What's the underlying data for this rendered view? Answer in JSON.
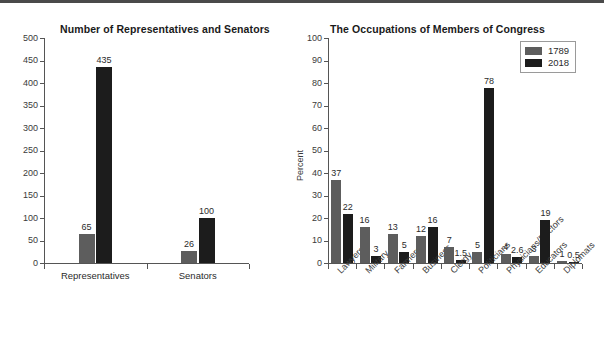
{
  "colors": {
    "series_1789": "#5d5d5d",
    "series_2018": "#1c1c1c",
    "axis": "#555555",
    "text": "#2b2b2b",
    "background": "#ffffff",
    "top_border": "#4a4a4a"
  },
  "legend": {
    "position": "top-right",
    "entries": [
      {
        "label": "1789",
        "color": "#5d5d5d"
      },
      {
        "label": "2018",
        "color": "#1c1c1c"
      }
    ]
  },
  "chart_data": [
    {
      "id": "chart-left",
      "type": "bar",
      "title": "Number of Representatives and Senators",
      "xlabel": "",
      "ylabel": "",
      "ylim": [
        0,
        500
      ],
      "yticks": [
        0,
        50,
        100,
        150,
        200,
        250,
        300,
        350,
        400,
        450,
        500
      ],
      "ytick_labels": [
        "0",
        "50",
        "100",
        "150",
        "200",
        "250",
        "300",
        "350",
        "400",
        "450",
        "500"
      ],
      "grid": false,
      "categories": [
        "Representatives",
        "Senators"
      ],
      "series": [
        {
          "name": "1789",
          "color": "#5d5d5d",
          "values": [
            65,
            26
          ],
          "labels": [
            "65",
            "26"
          ]
        },
        {
          "name": "2018",
          "color": "#1c1c1c",
          "values": [
            435,
            100
          ],
          "labels": [
            "435",
            "100"
          ]
        }
      ]
    },
    {
      "id": "chart-right",
      "type": "bar",
      "title": "The Occupations of Members of Congress",
      "xlabel": "",
      "ylabel": "Percent",
      "ylim": [
        0,
        100
      ],
      "yticks": [
        0,
        10,
        20,
        30,
        40,
        50,
        60,
        70,
        80,
        90,
        100
      ],
      "ytick_labels": [
        "0",
        "10",
        "20",
        "30",
        "40",
        "50",
        "60",
        "70",
        "80",
        "90",
        "100"
      ],
      "grid": false,
      "categories": [
        "Lawyers",
        "Military",
        "Farmers",
        "Business",
        "Clergy",
        "Politicians",
        "Physicians/Doctors",
        "Educators",
        "Diplomats"
      ],
      "series": [
        {
          "name": "1789",
          "color": "#5d5d5d",
          "values": [
            37,
            16,
            13,
            12,
            7,
            5,
            4,
            3,
            1
          ],
          "labels": [
            "37",
            "16",
            "13",
            "12",
            "7",
            "5",
            "4",
            "3",
            "1"
          ]
        },
        {
          "name": "2018",
          "color": "#1c1c1c",
          "values": [
            22,
            3,
            5,
            16,
            1.5,
            78,
            2.6,
            19,
            0.5
          ],
          "labels": [
            "22",
            "3",
            "5",
            "16",
            "1.5",
            "78",
            "2.6",
            "19",
            "0.5"
          ]
        }
      ]
    }
  ]
}
